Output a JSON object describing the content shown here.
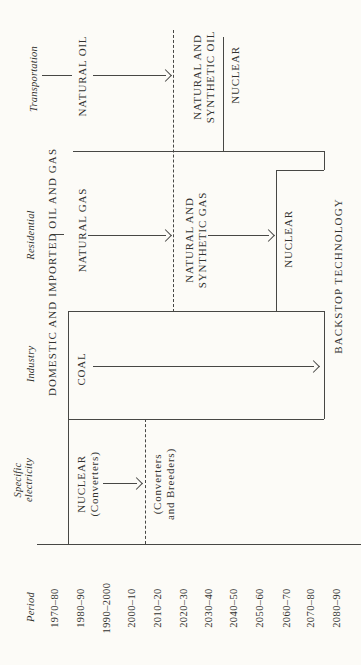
{
  "colors": {
    "ink": "#474744",
    "paper": "#fcfbf7",
    "text": "#32322f"
  },
  "sectors": {
    "transportation": {
      "label": "Transportation"
    },
    "residential": {
      "label": "Residential"
    },
    "industry": {
      "label": "Industry"
    },
    "specific_electricity": {
      "line1": "Specific",
      "line2": "electricity"
    }
  },
  "fuels": {
    "natural_oil": "NATURAL OIL",
    "nat_syn_oil_1": "NATURAL AND",
    "nat_syn_oil_2": "SYNTHETIC OIL",
    "nuclear_transport": "NUCLEAR",
    "oil_gas_banner": "DOMESTIC AND IMPORTED OIL AND GAS",
    "natural_gas": "NATURAL GAS",
    "nat_syn_gas_1": "NATURAL AND",
    "nat_syn_gas_2": "SYNTHETIC GAS",
    "nuclear_residential": "NUCLEAR",
    "backstop": "BACKSTOP TECHNOLOGY",
    "coal": "COAL",
    "nuclear_conv_1": "NUCLEAR",
    "nuclear_conv_2": "(Converters)",
    "breeders_1": "(Converters",
    "breeders_2": "and Breeders)"
  },
  "periods": {
    "label": "Period",
    "items": [
      "1970–80",
      "1980–90",
      "1990–2000",
      "2000–10",
      "2010–20",
      "2020–30",
      "2030–40",
      "2040–50",
      "2050–60",
      "2060–70",
      "2070–80",
      "2080–90"
    ]
  }
}
